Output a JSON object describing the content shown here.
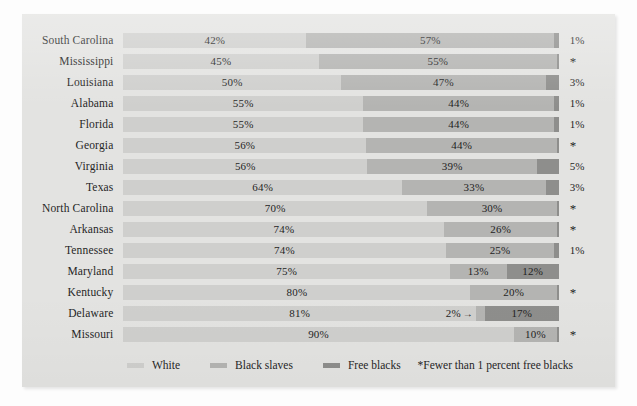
{
  "chart_data": {
    "type": "bar",
    "subtype": "stacked-horizontal-100",
    "title": "",
    "xlabel": "",
    "ylabel": "",
    "xlim": [
      0,
      100
    ],
    "grid": false,
    "legend_position": "bottom-left",
    "categories": [
      "South Carolina",
      "Mississippi",
      "Louisiana",
      "Alabama",
      "Florida",
      "Georgia",
      "Virginia",
      "Texas",
      "North Carolina",
      "Arkansas",
      "Tennessee",
      "Maryland",
      "Kentucky",
      "Delaware",
      "Missouri"
    ],
    "series": [
      {
        "name": "White",
        "color": "#cfcfcd",
        "values": [
          42,
          45,
          50,
          55,
          55,
          56,
          56,
          64,
          70,
          74,
          74,
          75,
          80,
          81,
          90
        ]
      },
      {
        "name": "Black slaves",
        "color": "#b4b4b2",
        "values": [
          57,
          55,
          47,
          44,
          44,
          44,
          39,
          33,
          30,
          26,
          25,
          13,
          20,
          2,
          10
        ]
      },
      {
        "name": "Free blacks",
        "color": "#8e8e8c",
        "values": [
          1,
          0.4,
          3,
          1,
          1,
          0.4,
          5,
          3,
          0.4,
          0.4,
          1,
          12,
          0.4,
          17,
          0.4
        ]
      }
    ],
    "annotations": [
      "2%→ points to the Delaware black-slaves segment",
      "* marks states with fewer than 1 percent free blacks"
    ]
  },
  "colors": {
    "panel_background": "#e3e3e1",
    "page_background": "#fdfdfd",
    "white_segment": "#cfcfcd",
    "slaves_segment": "#b4b4b2",
    "free_segment": "#8e8e8c",
    "text": "#262626"
  },
  "rows": [
    {
      "label": "South Carolina",
      "segments": [
        {
          "series": "white",
          "pct": 42,
          "text": "42%",
          "show": true
        },
        {
          "series": "slaves",
          "pct": 57,
          "text": "57%",
          "show": true
        },
        {
          "series": "free",
          "pct": 1,
          "text": "",
          "show": false
        }
      ],
      "note": "1%",
      "note_is_star": false
    },
    {
      "label": "Mississippi",
      "segments": [
        {
          "series": "white",
          "pct": 45,
          "text": "45%",
          "show": true
        },
        {
          "series": "slaves",
          "pct": 55,
          "text": "55%",
          "show": true
        },
        {
          "series": "free",
          "pct": 0.4,
          "text": "",
          "show": false
        }
      ],
      "note": "*",
      "note_is_star": true
    },
    {
      "label": "Louisiana",
      "segments": [
        {
          "series": "white",
          "pct": 50,
          "text": "50%",
          "show": true
        },
        {
          "series": "slaves",
          "pct": 47,
          "text": "47%",
          "show": true
        },
        {
          "series": "free",
          "pct": 3,
          "text": "",
          "show": false
        }
      ],
      "note": "3%",
      "note_is_star": false
    },
    {
      "label": "Alabama",
      "segments": [
        {
          "series": "white",
          "pct": 55,
          "text": "55%",
          "show": true
        },
        {
          "series": "slaves",
          "pct": 44,
          "text": "44%",
          "show": true
        },
        {
          "series": "free",
          "pct": 1,
          "text": "",
          "show": false
        }
      ],
      "note": "1%",
      "note_is_star": false
    },
    {
      "label": "Florida",
      "segments": [
        {
          "series": "white",
          "pct": 55,
          "text": "55%",
          "show": true
        },
        {
          "series": "slaves",
          "pct": 44,
          "text": "44%",
          "show": true
        },
        {
          "series": "free",
          "pct": 1,
          "text": "",
          "show": false
        }
      ],
      "note": "1%",
      "note_is_star": false
    },
    {
      "label": "Georgia",
      "segments": [
        {
          "series": "white",
          "pct": 56,
          "text": "56%",
          "show": true
        },
        {
          "series": "slaves",
          "pct": 44,
          "text": "44%",
          "show": true
        },
        {
          "series": "free",
          "pct": 0.4,
          "text": "",
          "show": false
        }
      ],
      "note": "*",
      "note_is_star": true
    },
    {
      "label": "Virginia",
      "segments": [
        {
          "series": "white",
          "pct": 56,
          "text": "56%",
          "show": true
        },
        {
          "series": "slaves",
          "pct": 39,
          "text": "39%",
          "show": true
        },
        {
          "series": "free",
          "pct": 5,
          "text": "",
          "show": false
        }
      ],
      "note": "5%",
      "note_is_star": false
    },
    {
      "label": "Texas",
      "segments": [
        {
          "series": "white",
          "pct": 64,
          "text": "64%",
          "show": true
        },
        {
          "series": "slaves",
          "pct": 33,
          "text": "33%",
          "show": true
        },
        {
          "series": "free",
          "pct": 3,
          "text": "",
          "show": false
        }
      ],
      "note": "3%",
      "note_is_star": false
    },
    {
      "label": "North Carolina",
      "segments": [
        {
          "series": "white",
          "pct": 70,
          "text": "70%",
          "show": true
        },
        {
          "series": "slaves",
          "pct": 30,
          "text": "30%",
          "show": true
        },
        {
          "series": "free",
          "pct": 0.4,
          "text": "",
          "show": false
        }
      ],
      "note": "*",
      "note_is_star": true
    },
    {
      "label": "Arkansas",
      "segments": [
        {
          "series": "white",
          "pct": 74,
          "text": "74%",
          "show": true
        },
        {
          "series": "slaves",
          "pct": 26,
          "text": "26%",
          "show": true
        },
        {
          "series": "free",
          "pct": 0.4,
          "text": "",
          "show": false
        }
      ],
      "note": "*",
      "note_is_star": true
    },
    {
      "label": "Tennessee",
      "segments": [
        {
          "series": "white",
          "pct": 74,
          "text": "74%",
          "show": true
        },
        {
          "series": "slaves",
          "pct": 25,
          "text": "25%",
          "show": true
        },
        {
          "series": "free",
          "pct": 1,
          "text": "",
          "show": false
        }
      ],
      "note": "1%",
      "note_is_star": false
    },
    {
      "label": "Maryland",
      "segments": [
        {
          "series": "white",
          "pct": 75,
          "text": "75%",
          "show": true
        },
        {
          "series": "slaves",
          "pct": 13,
          "text": "13%",
          "show": true
        },
        {
          "series": "free",
          "pct": 12,
          "text": "12%",
          "show": true
        }
      ],
      "note": "",
      "note_is_star": false
    },
    {
      "label": "Kentucky",
      "segments": [
        {
          "series": "white",
          "pct": 80,
          "text": "80%",
          "show": true
        },
        {
          "series": "slaves",
          "pct": 20,
          "text": "20%",
          "show": true
        },
        {
          "series": "free",
          "pct": 0.4,
          "text": "",
          "show": false
        }
      ],
      "note": "*",
      "note_is_star": true
    },
    {
      "label": "Delaware",
      "segments": [
        {
          "series": "white",
          "pct": 81,
          "text": "81%",
          "show": true
        },
        {
          "series": "slaves",
          "pct": 2,
          "text": "2%",
          "show": true,
          "outside": true,
          "arrow": "→"
        },
        {
          "series": "free",
          "pct": 17,
          "text": "17%",
          "show": true
        }
      ],
      "note": "",
      "note_is_star": false
    },
    {
      "label": "Missouri",
      "segments": [
        {
          "series": "white",
          "pct": 90,
          "text": "90%",
          "show": true
        },
        {
          "series": "slaves",
          "pct": 10,
          "text": "10%",
          "show": true
        },
        {
          "series": "free",
          "pct": 0.4,
          "text": "",
          "show": false
        }
      ],
      "note": "*",
      "note_is_star": true
    }
  ],
  "legend": {
    "items": [
      {
        "label": "White",
        "swatch": "#cfcfcd"
      },
      {
        "label": "Black slaves",
        "swatch": "#b4b4b2"
      },
      {
        "label": "Free blacks",
        "swatch": "#8e8e8c"
      }
    ]
  },
  "footnote": {
    "text": "*Fewer than 1 percent free blacks"
  }
}
